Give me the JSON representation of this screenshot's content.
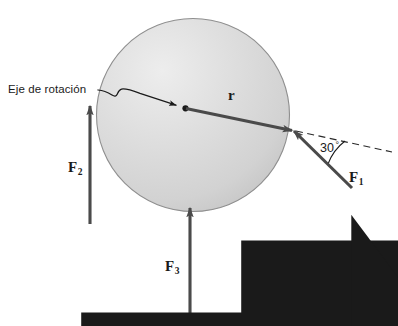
{
  "figure": {
    "background_color": "#ffffff",
    "width": 398,
    "height": 326
  },
  "disc": {
    "name": "rotating-disc",
    "center_x": 193,
    "center_y": 115,
    "radius": 97,
    "fill_color": "#d6d6d6",
    "highlight_color": "#ececec",
    "edge_color": "#8a8a8a"
  },
  "pivot": {
    "label": "Eje de rotación",
    "x": 185,
    "y": 108,
    "dot_color": "#1a1a1a"
  },
  "vectors": [
    {
      "id": "r",
      "symbol": "r",
      "subscript": "",
      "label_x": 231,
      "label_y": 96,
      "from_x": 122,
      "from_y": 93,
      "to_x": 292,
      "to_y": 130,
      "color": "#4a4a4a"
    },
    {
      "id": "F1",
      "symbol": "F",
      "subscript": "1",
      "label_x": 352,
      "label_y": 178,
      "from_x": 352,
      "from_y": 188,
      "to_x": 293,
      "to_y": 130,
      "color": "#4a4a4a"
    },
    {
      "id": "F2",
      "symbol": "F",
      "subscript": "2",
      "label_x": 71,
      "label_y": 168,
      "from_x": 90,
      "from_y": 224,
      "to_x": 90,
      "to_y": 106,
      "color": "#4a4a4a"
    },
    {
      "id": "F3",
      "symbol": "F",
      "subscript": "3",
      "label_x": 168,
      "label_y": 267,
      "from_x": 190,
      "from_y": 326,
      "to_x": 190,
      "to_y": 208,
      "color": "#4a4a4a"
    }
  ],
  "angle": {
    "value": "30",
    "degree_symbol": "°",
    "label_x": 322,
    "label_y": 148,
    "arc_color": "#1a1a1a"
  },
  "dashed_line": {
    "name": "reference-axis",
    "from_x": 293,
    "from_y": 130,
    "to_x": 392,
    "to_y": 152,
    "color": "#2a2a2a"
  },
  "leader_line": {
    "name": "pivot-leader",
    "color": "#1a1a1a"
  }
}
